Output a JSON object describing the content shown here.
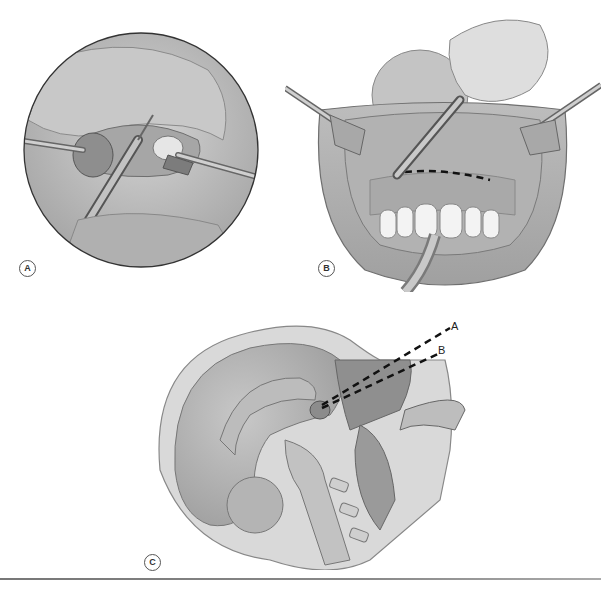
{
  "figure": {
    "panels": [
      {
        "id": "A",
        "label": "A",
        "description": "Circular inset: nasal speculum retractors with scalpel incising columella/nostril"
      },
      {
        "id": "B",
        "label": "B",
        "description": "Sublabial approach: retracted upper lip, scalpel with dashed incision line above upper teeth, tube in mouth"
      },
      {
        "id": "C",
        "label": "C",
        "description": "Sagittal section of head showing dashed surgical trajectories A and B to sella"
      }
    ],
    "trajectory_labels": {
      "a": "A",
      "b": "B"
    },
    "caption": "",
    "colors": {
      "background": "#ffffff",
      "tissue": "#b8b8b8",
      "tissue_dark": "#8a8a8a",
      "tissue_light": "#d6d6d6",
      "dashed_line": "#111111",
      "rule": "#808080"
    }
  }
}
